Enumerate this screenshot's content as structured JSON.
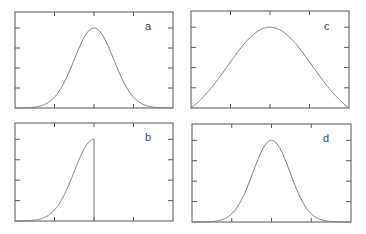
{
  "figure": {
    "axis_color": "#555555",
    "curve_color": "#777777",
    "background": "#ffffff"
  },
  "chart_data": [
    {
      "type": "line",
      "label": "a",
      "title": "",
      "xlabel": "",
      "ylabel": "",
      "description": "Gaussian bell curve centered at x midpoint",
      "xlim": [
        -3,
        3
      ],
      "ylim": [
        0,
        1.2
      ],
      "x_ticks": [
        -1.5,
        0,
        1.5
      ],
      "y_tick_count": 4,
      "series": [
        {
          "name": "a",
          "shape": "gaussian",
          "center": 0,
          "sigma": 0.75,
          "peak": 1.0
        }
      ],
      "grid": false
    },
    {
      "type": "line",
      "label": "c",
      "title": "",
      "xlabel": "",
      "ylabel": "",
      "description": "Broad bell (cosine-like) curve spanning full x range, peaking at center",
      "xlim": [
        -3,
        3
      ],
      "ylim": [
        0,
        1.2
      ],
      "x_ticks": [
        -1.5,
        0,
        1.5
      ],
      "y_tick_count": 4,
      "series": [
        {
          "name": "c",
          "shape": "broad-bell",
          "center": 0,
          "sigma": 1.6,
          "peak": 1.0
        }
      ],
      "grid": false
    },
    {
      "type": "line",
      "label": "b",
      "title": "",
      "xlabel": "",
      "ylabel": "",
      "description": "Left half of Gaussian rising to peak at center, then vertical drop to zero",
      "xlim": [
        -3,
        3
      ],
      "ylim": [
        0,
        1.2
      ],
      "x_ticks": [
        -1.5,
        0,
        1.5
      ],
      "y_tick_count": 4,
      "series": [
        {
          "name": "b",
          "shape": "half-gaussian-left",
          "center": 0,
          "sigma": 0.75,
          "peak": 1.0,
          "cutoff_x": 0
        }
      ],
      "grid": false
    },
    {
      "type": "line",
      "label": "d",
      "title": "",
      "xlabel": "",
      "ylabel": "",
      "description": "Gaussian bell curve centered at x midpoint",
      "xlim": [
        -3,
        3
      ],
      "ylim": [
        0,
        1.2
      ],
      "x_ticks": [
        -1.5,
        0,
        1.5
      ],
      "y_tick_count": 4,
      "series": [
        {
          "name": "d",
          "shape": "gaussian",
          "center": 0,
          "sigma": 0.7,
          "peak": 1.0
        }
      ],
      "grid": false
    }
  ],
  "panels": {
    "a": {
      "label": "a"
    },
    "b": {
      "label": "b"
    },
    "c": {
      "label": "c"
    },
    "d": {
      "label": "d"
    }
  }
}
